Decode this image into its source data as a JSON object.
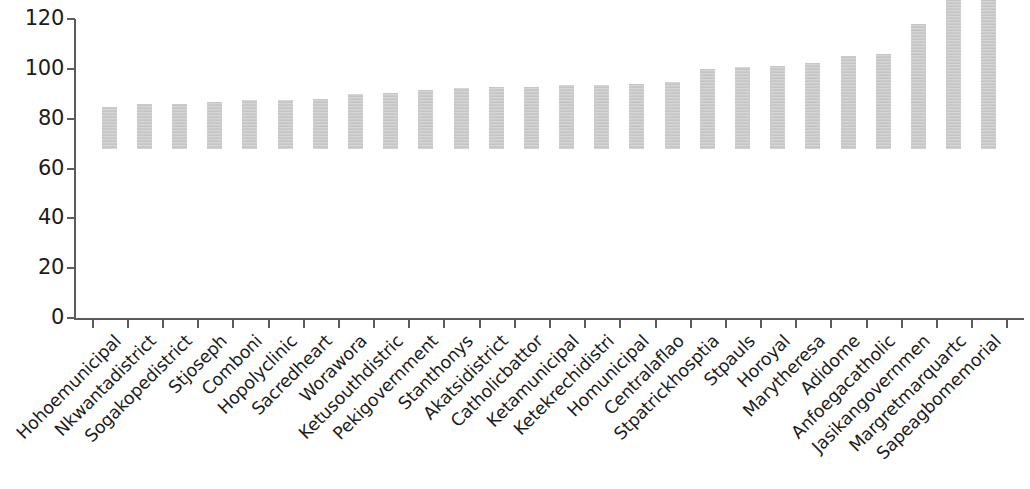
{
  "chart_data": {
    "type": "bar",
    "title": "",
    "subtitle": "",
    "xlabel": "",
    "ylabel": "",
    "ylim": [
      0,
      120
    ],
    "ytick_values": [
      0,
      20,
      40,
      60,
      80,
      100,
      120
    ],
    "ytick_labels": [
      "0",
      "20",
      "40",
      "60",
      "80",
      "100",
      "120"
    ],
    "grid": false,
    "legend": false,
    "legend_position": "none",
    "bar_color": "#c9c9c9",
    "axis_color": "#5c5c5c",
    "categories": [
      "Hohoemunicipal",
      "Nkwantadistrict",
      "Sogakopedistrict",
      "Stjoseph",
      "Comboni",
      "Hopolyclinic",
      "Sacredheart",
      "Worawora",
      "Ketusouthdistric",
      "Pekigovernment",
      "Stanthonys",
      "Akatsidistrict",
      "Catholicbattor",
      "Ketamunicipal",
      "Ketekrechidistri",
      "Homunicipal",
      "Centralaflao",
      "Stpatrickhosptia",
      "Stpauls",
      "Horoyal",
      "Marytheresa",
      "Adidome",
      "Anfoegacatholic",
      "Jasikangovernmen",
      "Margretmarquartc",
      "Sapeagbomemorial"
    ],
    "values": [
      17,
      18,
      18,
      19,
      19.5,
      19.5,
      20,
      22,
      22.5,
      23.5,
      24.5,
      25,
      25,
      25.5,
      25.5,
      26,
      27,
      32,
      33,
      33.5,
      34.5,
      37.5,
      38,
      50,
      94.5,
      114
    ]
  }
}
